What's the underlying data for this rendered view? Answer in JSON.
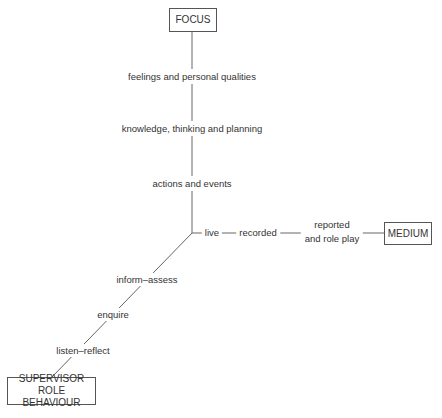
{
  "diagram": {
    "type": "three-axis model",
    "axes": {
      "focus": {
        "title": "FOCUS",
        "levels": [
          "feelings and personal qualities",
          "knowledge, thinking and planning",
          "actions and events"
        ]
      },
      "medium": {
        "title": "MEDIUM",
        "levels": [
          "live",
          "recorded",
          "reported",
          "and role play"
        ]
      },
      "supervisor_role": {
        "title_line1": "SUPERVISOR",
        "title_line2": "ROLE BEHAVIOUR",
        "levels": [
          "inform–assess",
          "enquire",
          "listen–reflect"
        ]
      }
    },
    "colors": {
      "line": "#666666",
      "text": "#333333",
      "box_border": "#555555"
    }
  }
}
